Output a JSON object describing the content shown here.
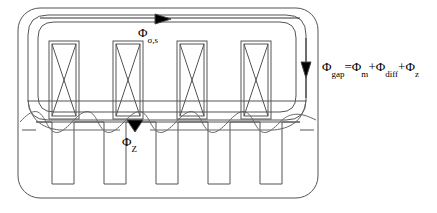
{
  "figure": {
    "type": "engineering-cross-section-diagram",
    "background_color": "#ffffff",
    "line_color": "#000000",
    "stroke_width": 1
  },
  "labels": {
    "stator_leakage": {
      "name": "stator-leakage-flux-label",
      "base": "Φ",
      "subscript": "σ,s",
      "full_text": "Φσ,s",
      "x": 138,
      "y": 24
    },
    "airgap_equation": {
      "name": "airgap-flux-equation-label",
      "segments": [
        {
          "base": "Φ",
          "sub": "gap"
        },
        {
          "base": "=Φ",
          "sub": "m"
        },
        {
          "base": "+Φ",
          "sub": "diff"
        },
        {
          "base": "+Φ",
          "sub": "z"
        }
      ],
      "full_text": "Φgap=Φm+Φdiff+Φz",
      "x": 322,
      "y": 58
    },
    "tooth_flux": {
      "name": "tooth-flux-label",
      "base": "Φ",
      "subscript": "Z",
      "full_text": "ΦZ",
      "x": 122,
      "y": 133
    }
  },
  "geometry": {
    "outer_boundary": {
      "name": "outer-machine-boundary",
      "x": 18,
      "y": 8,
      "width": 300,
      "height": 190,
      "corner_radius": 22
    },
    "stator_leakage_path": {
      "name": "stator-leakage-flux-path",
      "x": 28,
      "y": 15,
      "width": 278,
      "height": 105,
      "corner_radius": 20
    },
    "inner_leakage_path": {
      "name": "inner-leakage-flux-path",
      "x": 38,
      "y": 22,
      "width": 258,
      "height": 90,
      "corner_radius": 16
    },
    "yoke_line_y": 101,
    "airgap_line_y": 122,
    "coils": {
      "name": "stator-coils",
      "count": 4,
      "width": 30,
      "height": 78,
      "top": 41,
      "inner_inset": 3,
      "x_positions": [
        49,
        113,
        177,
        241
      ]
    },
    "rotor_slots": {
      "name": "rotor-slots",
      "count": 5,
      "width": 22,
      "height": 62,
      "top": 122,
      "x_positions": [
        52,
        104,
        156,
        208,
        260
      ]
    },
    "flux_wave": {
      "name": "airgap-flux-density-wave",
      "description": "sinusoidal airgap flux density waveform",
      "baseline_y": 122,
      "amplitude": 14,
      "period": 104,
      "x_start": 20,
      "x_end": 316
    },
    "arrows": [
      {
        "name": "stator-leakage-arrow",
        "x": 163,
        "y": 18,
        "direction": "right"
      },
      {
        "name": "airgap-flux-arrow",
        "x": 306,
        "y": 70,
        "direction": "down"
      },
      {
        "name": "tooth-flux-arrow",
        "x": 135,
        "y": 124,
        "direction": "down"
      }
    ]
  }
}
